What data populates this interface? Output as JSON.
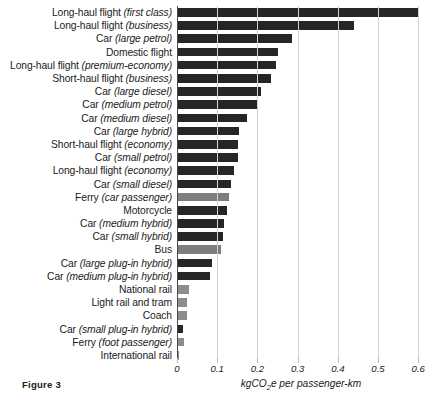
{
  "figure": {
    "caption": "Figure 3"
  },
  "chart_data": {
    "type": "bar",
    "orientation": "horizontal",
    "title": "",
    "xlabel": "kgCO₂e per passenger-km",
    "xlabel_main": "kgCO",
    "xlabel_sub": "2",
    "xlabel_tail": "e per passenger-km",
    "ylabel": "",
    "xlim": [
      0,
      0.63
    ],
    "grid": true,
    "legend": "none",
    "ticks": [
      "0",
      "0.1",
      "0.2",
      "0.3",
      "0.4",
      "0.5",
      "0.6"
    ],
    "tick_values": [
      0,
      0.1,
      0.2,
      0.3,
      0.4,
      0.5,
      0.6
    ],
    "colors": {
      "dark": "#262626",
      "grey": "#7d7d7d",
      "light_grey": "#8c8c8c",
      "gridline": "#d2d2d2",
      "axis": "#4a4a4a"
    },
    "categories": [
      "Long-haul flight (first class)",
      "Long-haul flight (business)",
      "Car (large petrol)",
      "Domestic flight",
      "Long-haul flight (premium-economy)",
      "Short-haul flight (business)",
      "Car (large diesel)",
      "Car (medium petrol)",
      "Car (medium diesel)",
      "Car (large hybrid)",
      "Short-haul flight (economy)",
      "Car (small petrol)",
      "Long-haul flight (economy)",
      "Car (small diesel)",
      "Ferry (car passenger)",
      "Motorcycle",
      "Car (medium hybrid)",
      "Car (small hybrid)",
      "Bus",
      "Car (large plug-in hybrid)",
      "Car (medium plug-in hybrid)",
      "National rail",
      "Light rail and tram",
      "Coach",
      "Car (small plug-in hybrid)",
      "Ferry (foot passenger)",
      "International rail"
    ],
    "values": [
      0.6,
      0.441,
      0.286,
      0.251,
      0.246,
      0.234,
      0.209,
      0.199,
      0.174,
      0.154,
      0.152,
      0.152,
      0.142,
      0.134,
      0.129,
      0.124,
      0.117,
      0.114,
      0.11,
      0.087,
      0.082,
      0.03,
      0.024,
      0.025,
      0.016,
      0.018,
      0.005
    ],
    "bars": [
      {
        "label_plain": "Long-haul flight",
        "label_italic": "(first class)",
        "value": 0.6,
        "shade": "dark"
      },
      {
        "label_plain": "Long-haul flight",
        "label_italic": "(business)",
        "value": 0.441,
        "shade": "dark"
      },
      {
        "label_plain": "Car",
        "label_italic": "(large petrol)",
        "value": 0.286,
        "shade": "dark"
      },
      {
        "label_plain": "Domestic flight",
        "label_italic": "",
        "value": 0.251,
        "shade": "dark"
      },
      {
        "label_plain": "Long-haul flight",
        "label_italic": "(premium-economy)",
        "value": 0.246,
        "shade": "dark"
      },
      {
        "label_plain": "Short-haul flight",
        "label_italic": "(business)",
        "value": 0.234,
        "shade": "dark"
      },
      {
        "label_plain": "Car",
        "label_italic": "(large diesel)",
        "value": 0.209,
        "shade": "dark"
      },
      {
        "label_plain": "Car",
        "label_italic": "(medium petrol)",
        "value": 0.199,
        "shade": "dark"
      },
      {
        "label_plain": "Car",
        "label_italic": "(medium diesel)",
        "value": 0.174,
        "shade": "dark"
      },
      {
        "label_plain": "Car",
        "label_italic": "(large hybrid)",
        "value": 0.154,
        "shade": "dark"
      },
      {
        "label_plain": "Short-haul flight",
        "label_italic": "(economy)",
        "value": 0.152,
        "shade": "dark"
      },
      {
        "label_plain": "Car",
        "label_italic": "(small petrol)",
        "value": 0.152,
        "shade": "dark"
      },
      {
        "label_plain": "Long-haul flight",
        "label_italic": "(economy)",
        "value": 0.142,
        "shade": "dark"
      },
      {
        "label_plain": "Car",
        "label_italic": "(small diesel)",
        "value": 0.134,
        "shade": "dark"
      },
      {
        "label_plain": "Ferry",
        "label_italic": "(car passenger)",
        "value": 0.129,
        "shade": "grey"
      },
      {
        "label_plain": "Motorcycle",
        "label_italic": "",
        "value": 0.124,
        "shade": "dark"
      },
      {
        "label_plain": "Car",
        "label_italic": "(medium hybrid)",
        "value": 0.117,
        "shade": "dark"
      },
      {
        "label_plain": "Car",
        "label_italic": "(small hybrid)",
        "value": 0.114,
        "shade": "dark"
      },
      {
        "label_plain": "Bus",
        "label_italic": "",
        "value": 0.11,
        "shade": "grey"
      },
      {
        "label_plain": "Car",
        "label_italic": "(large plug-in hybrid)",
        "value": 0.087,
        "shade": "dark"
      },
      {
        "label_plain": "Car",
        "label_italic": "(medium plug-in hybrid)",
        "value": 0.082,
        "shade": "dark"
      },
      {
        "label_plain": "National rail",
        "label_italic": "",
        "value": 0.03,
        "shade": "light_grey"
      },
      {
        "label_plain": "Light rail and tram",
        "label_italic": "",
        "value": 0.024,
        "shade": "light_grey"
      },
      {
        "label_plain": "Coach",
        "label_italic": "",
        "value": 0.025,
        "shade": "light_grey"
      },
      {
        "label_plain": "Car",
        "label_italic": "(small plug-in hybrid)",
        "value": 0.016,
        "shade": "dark"
      },
      {
        "label_plain": "Ferry",
        "label_italic": "(foot passenger)",
        "value": 0.018,
        "shade": "light_grey"
      },
      {
        "label_plain": "International rail",
        "label_italic": "",
        "value": 0.005,
        "shade": "light_grey"
      }
    ]
  }
}
